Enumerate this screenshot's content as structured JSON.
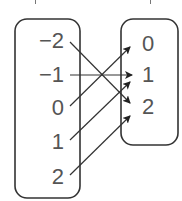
{
  "diagram": {
    "type": "mapping-diagram",
    "domain": {
      "name": "domain-set",
      "values": [
        "−2",
        "−1",
        "0",
        "1",
        "2"
      ]
    },
    "range": {
      "name": "range-set",
      "values": [
        "0",
        "1",
        "2"
      ]
    },
    "mappings": [
      {
        "from": "−2",
        "to": "2"
      },
      {
        "from": "−1",
        "to": "1"
      },
      {
        "from": "0",
        "to": "0"
      },
      {
        "from": "1",
        "to": "1"
      },
      {
        "from": "2",
        "to": "2"
      }
    ],
    "colors": {
      "stroke": "#333333",
      "text": "#555555",
      "background": "#ffffff"
    }
  }
}
